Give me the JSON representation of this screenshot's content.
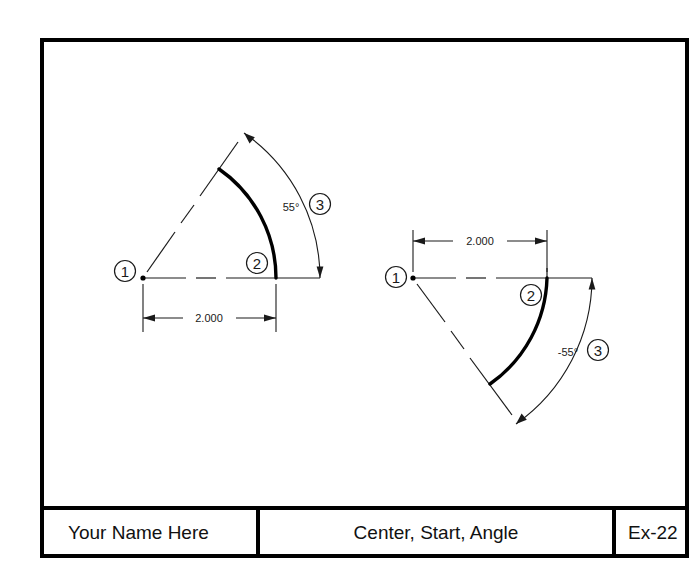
{
  "sheet": {
    "background_color": "#ffffff",
    "line_color": "#1a1a1a",
    "border_color": "#000000",
    "object_color": "#000000"
  },
  "title_block": {
    "name_field": "Your Name Here",
    "title_field": "Center, Start, Angle",
    "number_field": "Ex-22"
  },
  "left_figure": {
    "label": "positive angle arc",
    "center_marker": "1",
    "start_marker": "2",
    "angle_marker": "3",
    "radius_dimension": "2.000",
    "angle_dimension": "55°"
  },
  "right_figure": {
    "label": "negative angle arc",
    "center_marker": "1",
    "start_marker": "2",
    "angle_marker": "3",
    "radius_dimension": "2.000",
    "angle_dimension": "-55°"
  }
}
